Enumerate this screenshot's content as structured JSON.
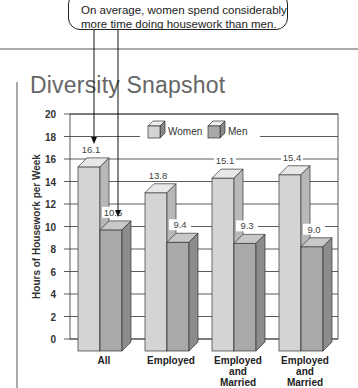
{
  "annotation": {
    "line1": "On average, women spend considerably",
    "line2": "more time doing housework than men."
  },
  "header": {
    "title": "Diversity Snapshot"
  },
  "colors": {
    "women": "#d4d4d4",
    "men": "#a9a9a9",
    "grid": "#333333"
  },
  "chart_data": {
    "type": "bar",
    "title": "Diversity Snapshot",
    "xlabel": "",
    "ylabel": "Hours of Housework per Week",
    "ylim": [
      0,
      20
    ],
    "yticks": [
      0,
      2,
      4,
      6,
      8,
      10,
      12,
      14,
      16,
      18,
      20
    ],
    "grid": true,
    "legend_position": "top",
    "categories": [
      "All",
      "Employed",
      "Employed and Married",
      "Employed and Married"
    ],
    "series": [
      {
        "name": "Women",
        "values": [
          16.1,
          13.8,
          15.1,
          15.4
        ]
      },
      {
        "name": "Men",
        "values": [
          10.5,
          9.4,
          9.3,
          9.0
        ]
      }
    ],
    "annotations": [
      "On average, women spend considerably more time doing housework than men."
    ]
  }
}
